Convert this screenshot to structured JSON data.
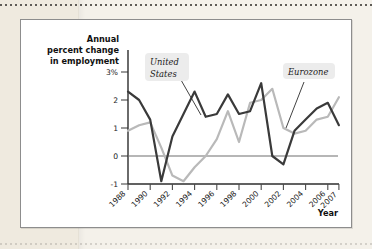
{
  "figure": {
    "background_color": "#ffffff",
    "border_color": "#8d8d8d",
    "page_color": "#f4f1ea"
  },
  "chart_data": {
    "type": "line",
    "title": "",
    "ylabel": "Annual percent change in employment",
    "xlabel": "Year",
    "ylim": [
      -1,
      3
    ],
    "xlim": [
      1988,
      2007
    ],
    "yticks": [
      "3%",
      "2",
      "1",
      "0",
      "-1"
    ],
    "ytick_values": [
      3,
      2,
      1,
      0,
      -1
    ],
    "xticks": [
      "1988",
      "1990",
      "1992",
      "1994",
      "1996",
      "1998",
      "2000",
      "2002",
      "2004",
      "2006",
      "2007"
    ],
    "xtick_values": [
      1988,
      1990,
      1992,
      1994,
      1996,
      1998,
      2000,
      2002,
      2004,
      2006,
      2007
    ],
    "grid": false,
    "legend_position": "inline-callout",
    "zero_line": true,
    "x": [
      1988,
      1989,
      1990,
      1991,
      1992,
      1993,
      1994,
      1995,
      1996,
      1997,
      1998,
      1999,
      2000,
      2001,
      2002,
      2003,
      2004,
      2005,
      2006,
      2007
    ],
    "series": [
      {
        "name": "United States",
        "color": "#3a3a3a",
        "linewidth": 2.2,
        "values": [
          2.3,
          2.0,
          1.3,
          -0.9,
          0.7,
          1.5,
          2.3,
          1.4,
          1.5,
          2.2,
          1.5,
          1.6,
          2.6,
          0.0,
          -0.3,
          0.9,
          1.3,
          1.7,
          1.9,
          1.1
        ]
      },
      {
        "name": "Eurozone",
        "color": "#b9b9b9",
        "linewidth": 2.2,
        "values": [
          0.9,
          1.1,
          1.2,
          0.3,
          -0.7,
          -0.9,
          -0.4,
          0.0,
          0.6,
          1.6,
          0.5,
          1.9,
          2.0,
          2.4,
          1.0,
          0.8,
          0.9,
          1.3,
          1.4,
          2.1
        ]
      }
    ],
    "annotations": [
      {
        "label": "United States",
        "label_line1": "United",
        "label_line2": "States",
        "points_to": "us-line"
      },
      {
        "label": "Eurozone",
        "label_line1": "Eurozone",
        "label_line2": "",
        "points_to": "eurozone-line"
      }
    ]
  },
  "labels": {
    "y_axis_line1": "Annual",
    "y_axis_line2": "percent change",
    "y_axis_line3": "in employment",
    "x_axis": "Year"
  }
}
